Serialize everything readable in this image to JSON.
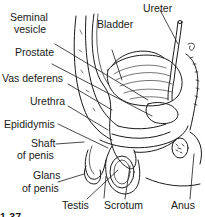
{
  "diagram": {
    "type": "anatomical-cross-section",
    "labels": {
      "seminal_vesicle_1": "Seminal",
      "seminal_vesicle_2": "vesicle",
      "bladder": "Bladder",
      "ureter": "Ureter",
      "prostate": "Prostate",
      "vas_deferens": "Vas deferens",
      "urethra": "Urethra",
      "epididymis": "Epididymis",
      "shaft_1": "Shaft",
      "shaft_2": "of penis",
      "glans_1": "Glans",
      "glans_2": "of penis",
      "testis": "Testis",
      "scrotum": "Scrotum",
      "anus": "Anus",
      "figure_fragment": "1-37"
    },
    "colors": {
      "ink": "#1a1a1a",
      "background": "#ffffff"
    }
  }
}
